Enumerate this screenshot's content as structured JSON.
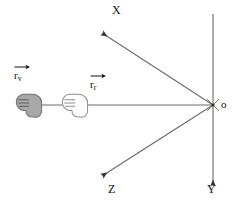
{
  "diagram": {
    "background_color": "#ffffff",
    "line_color": "#555555",
    "label_color": "#111111",
    "origin": {
      "label": "o",
      "x": 213,
      "y": 105
    },
    "axes": [
      {
        "name": "x-axis",
        "label": "X",
        "label_x": 112,
        "label_y": 6,
        "from_x": 213,
        "from_y": 105,
        "to_x": 100,
        "to_y": 31,
        "arrow": "end"
      },
      {
        "name": "z-axis",
        "label": "Z",
        "label_x": 108,
        "label_y": 185,
        "from_x": 213,
        "from_y": 105,
        "to_x": 100,
        "to_y": 178,
        "arrow": "end"
      },
      {
        "name": "y-axis",
        "label": "Y",
        "label_x": 206,
        "label_y": 185,
        "from_x": 213,
        "from_y": 14,
        "to_x": 213,
        "to_y": 188,
        "arrow": "end"
      },
      {
        "name": "horizontal-axis",
        "label": "",
        "label_x": 0,
        "label_y": 0,
        "from_x": 213,
        "from_y": 105,
        "to_x": 30,
        "to_y": 105,
        "arrow": "mid"
      }
    ],
    "vectors": [
      {
        "name": "r-v",
        "base": "r",
        "subscript": "v",
        "label_x": 14,
        "label_y": 66,
        "arrow_width": 14
      },
      {
        "name": "r-r",
        "base": "r",
        "subscript": "r",
        "label_x": 90,
        "label_y": 75,
        "arrow_width": 14
      }
    ],
    "hands": [
      {
        "name": "hand-filled",
        "fill": "#a8a8a8",
        "stroke": "#6e6e6e",
        "x": 14,
        "y": 92,
        "width": 30,
        "height": 26,
        "filled": true
      },
      {
        "name": "hand-outline",
        "fill": "#ffffff",
        "stroke": "#8a8a8a",
        "x": 60,
        "y": 92,
        "width": 30,
        "height": 26,
        "filled": false
      }
    ],
    "arrowheads": [
      {
        "name": "arrowhead-left-outer",
        "x": 38,
        "y": 105
      },
      {
        "name": "arrowhead-left-inner",
        "x": 85,
        "y": 105
      }
    ]
  }
}
